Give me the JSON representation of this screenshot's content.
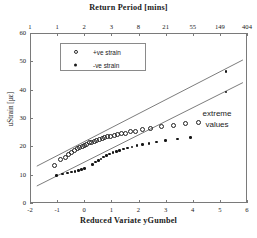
{
  "chart_data": {
    "type": "scatter",
    "title": "Return Period [mins]",
    "xlabel": "Reduced Variate yGumbel",
    "ylabel": "uStrain [µε]",
    "xlim": [
      -2,
      6
    ],
    "ylim": [
      0,
      60
    ],
    "grid": false,
    "legend_position": "top-left",
    "xticks": [
      -2,
      -1,
      0,
      1,
      2,
      3,
      4,
      5,
      6
    ],
    "xticklabels": [
      "-2",
      "-1",
      "0",
      "1",
      "2",
      "3",
      "4",
      "5",
      "6"
    ],
    "yticks": [
      0,
      10,
      20,
      30,
      40,
      50,
      60
    ],
    "yticklabels": [
      "0",
      "10",
      "20",
      "30",
      "40",
      "50",
      "60"
    ],
    "top_axis": {
      "label": "Return Period [mins]",
      "tick_x": [
        -2,
        -1,
        0,
        1,
        2,
        3,
        4,
        5,
        6
      ],
      "ticklabels": [
        "1",
        "1",
        "2",
        "3",
        "8",
        "21",
        "55",
        "149",
        "404"
      ]
    },
    "annotations": [
      {
        "text": "extreme values",
        "x": 4.2,
        "y": 31
      }
    ],
    "series": [
      {
        "name": "+ve strain",
        "marker": "open-circle",
        "color": "#1f1f1f",
        "points": [
          [
            -1.08,
            13.2
          ],
          [
            -0.86,
            15.4
          ],
          [
            -0.7,
            16.1
          ],
          [
            -0.58,
            17.0
          ],
          [
            -0.46,
            17.8
          ],
          [
            -0.36,
            18.6
          ],
          [
            -0.26,
            19.1
          ],
          [
            -0.17,
            19.6
          ],
          [
            -0.08,
            20.0
          ],
          [
            0.01,
            20.4
          ],
          [
            0.1,
            20.8
          ],
          [
            0.19,
            21.2
          ],
          [
            0.28,
            21.5
          ],
          [
            0.37,
            21.8
          ],
          [
            0.46,
            22.1
          ],
          [
            0.56,
            22.4
          ],
          [
            0.66,
            22.7
          ],
          [
            0.76,
            23.0
          ],
          [
            0.87,
            23.3
          ],
          [
            0.98,
            23.5
          ],
          [
            1.1,
            23.8
          ],
          [
            1.23,
            24.1
          ],
          [
            1.37,
            24.4
          ],
          [
            1.52,
            24.7
          ],
          [
            1.7,
            25.1
          ],
          [
            1.9,
            25.4
          ],
          [
            2.14,
            25.8
          ],
          [
            2.45,
            26.2
          ],
          [
            2.86,
            26.9
          ],
          [
            3.3,
            27.4
          ],
          [
            3.75,
            27.9
          ],
          [
            4.2,
            28.4
          ]
        ]
      },
      {
        "name": "-ve strain",
        "marker": "filled-dot",
        "color": "#141414",
        "points": [
          [
            -1.02,
            9.8
          ],
          [
            -0.8,
            10.2
          ],
          [
            -0.62,
            10.6
          ],
          [
            -0.48,
            10.9
          ],
          [
            -0.34,
            11.2
          ],
          [
            -0.22,
            11.5
          ],
          [
            -0.1,
            11.8
          ],
          [
            0.02,
            12.1
          ],
          [
            0.3,
            13.6
          ],
          [
            0.42,
            14.4
          ],
          [
            0.52,
            15.0
          ],
          [
            0.62,
            15.6
          ],
          [
            0.72,
            16.2
          ],
          [
            0.83,
            16.8
          ],
          [
            0.94,
            17.3
          ],
          [
            1.06,
            17.8
          ],
          [
            1.18,
            18.2
          ],
          [
            1.31,
            18.6
          ],
          [
            1.45,
            19.0
          ],
          [
            1.6,
            19.4
          ],
          [
            1.76,
            19.8
          ],
          [
            1.94,
            20.2
          ],
          [
            2.14,
            20.6
          ],
          [
            2.38,
            21.0
          ],
          [
            2.66,
            21.5
          ],
          [
            3.0,
            22.0
          ],
          [
            3.44,
            22.6
          ],
          [
            3.92,
            23.2
          ]
        ]
      },
      {
        "name": "extreme values",
        "marker": "filled-dot",
        "color": "#141414",
        "points": [
          [
            5.22,
            46.5
          ],
          [
            5.22,
            39.2
          ]
        ]
      }
    ],
    "fit_lines": [
      {
        "name": "+ve strain fit",
        "x": [
          -1.75,
          5.85
        ],
        "y": [
          13.0,
          50.5
        ],
        "color": "#5a5a5a"
      },
      {
        "name": "-ve strain fit",
        "x": [
          -1.75,
          5.85
        ],
        "y": [
          6.0,
          42.5
        ],
        "color": "#5a5a5a"
      }
    ]
  },
  "legend": {
    "entries": [
      {
        "label": "+ve strain",
        "marker": "open-circle"
      },
      {
        "label": "-ve strain",
        "marker": "filled-dot"
      }
    ]
  }
}
